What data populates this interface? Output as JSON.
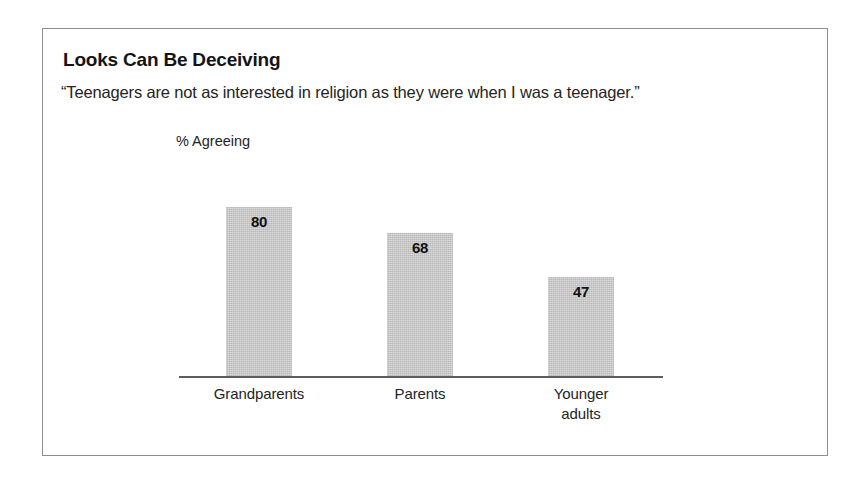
{
  "figure": {
    "title": "Looks Can Be Deceiving",
    "subtitle": "“Teenagers are not as interested in religion as they were when I was a teenager.”",
    "axis_label": "% Agreeing",
    "frame_color": "#8d8d8d",
    "bar_color": "#b8b8b8",
    "baseline_color": "#5d5d5d",
    "background": "#ffffff"
  },
  "chart_data": {
    "type": "bar",
    "title": "Looks Can Be Deceiving",
    "subtitle": "“Teenagers are not as interested in religion as they were when I was a teenager.”",
    "xlabel": "",
    "ylabel": "% Agreeing",
    "ylim": [
      0,
      100
    ],
    "grid": false,
    "legend": "none",
    "value_labels_inside_bars": true,
    "categories": [
      "Grandparents",
      "Parents",
      "Younger adults"
    ],
    "category_lines": [
      [
        "Grandparents"
      ],
      [
        "Parents"
      ],
      [
        "Younger",
        "adults"
      ]
    ],
    "values": [
      80,
      68,
      47
    ],
    "value_labels": [
      "80",
      "68",
      "47"
    ],
    "series": [
      {
        "name": "% Agreeing",
        "values": [
          80,
          68,
          47
        ]
      }
    ]
  }
}
